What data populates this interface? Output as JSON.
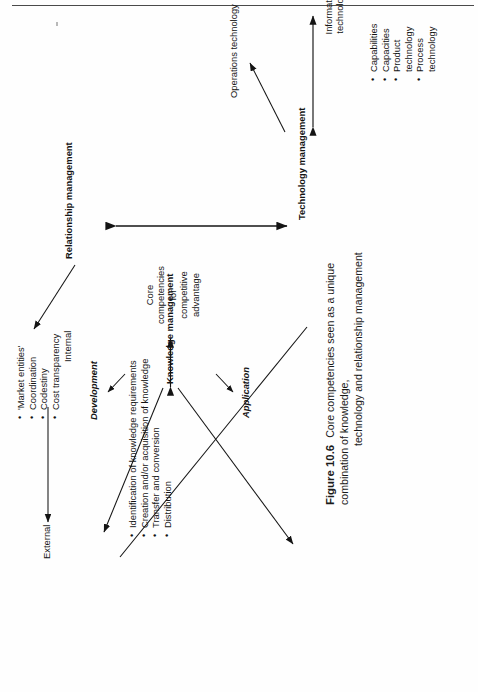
{
  "figure": {
    "number": "Figure 10.6",
    "caption_line1": "Core competencies seen as a unique combination of knowledge,",
    "caption_line2": "technology and relationship management"
  },
  "nodes": {
    "knowledge_management": "Knowledge management",
    "technology_management": "Technology management",
    "relationship_management": "Relationship management",
    "core_competencies": "Core\ncompetencies\nfor\ncompetitive\nadvantage"
  },
  "knowledge": {
    "development_label": "Development",
    "application_label": "Application",
    "bullets": [
      "Identification of knowledge requirements",
      "Creation and/or acquisition of knowledge",
      "Transfer and conversion",
      "Distribution"
    ]
  },
  "technology": {
    "information_technology": "Information\ntechnology",
    "operations_technology": "Operations technology",
    "bullets": [
      "Capabilities",
      "Capacities",
      "Product\ntechnology",
      "Process\ntechnology"
    ]
  },
  "relationship": {
    "internal_label": "Internal",
    "external_label": "External",
    "bullets": [
      "'Market entities'",
      "Coordination",
      "Codestiny",
      "Cost transparency"
    ]
  },
  "style": {
    "ink": "#141414",
    "rule": "#4a4a4a",
    "paper": "#fefefe"
  }
}
